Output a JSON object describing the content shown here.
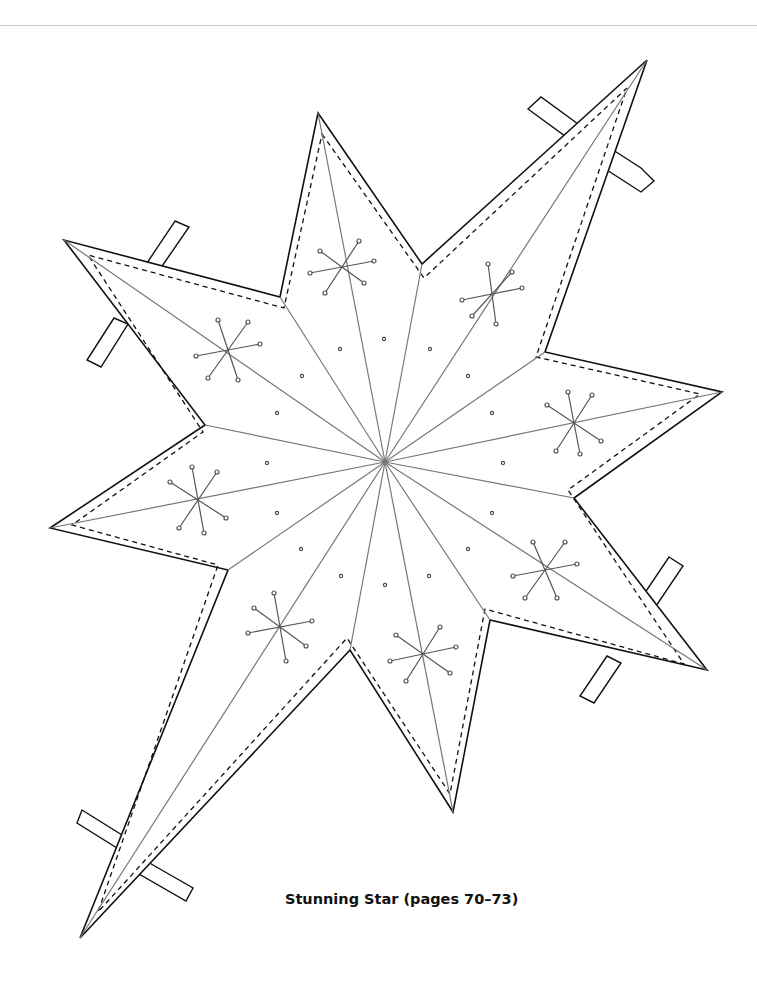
{
  "caption": "Stunning Star (pages 70–73)",
  "figure": {
    "type": "8-point star template",
    "stroke_color": "#111111",
    "score_line_color": "#777777",
    "center": [
      385,
      462
    ],
    "outer_points": [
      [
        318,
        113
      ],
      [
        647,
        60
      ],
      [
        722,
        392
      ],
      [
        707,
        670
      ],
      [
        453,
        812
      ],
      [
        80,
        938
      ],
      [
        50,
        528
      ],
      [
        64,
        240
      ]
    ],
    "inner_points": [
      [
        422,
        264
      ],
      [
        545,
        352
      ],
      [
        574,
        498
      ],
      [
        490,
        620
      ],
      [
        350,
        650
      ],
      [
        228,
        570
      ],
      [
        205,
        425
      ],
      [
        280,
        297
      ]
    ],
    "tabs_count": 8,
    "snowflake_decorations": 8
  }
}
